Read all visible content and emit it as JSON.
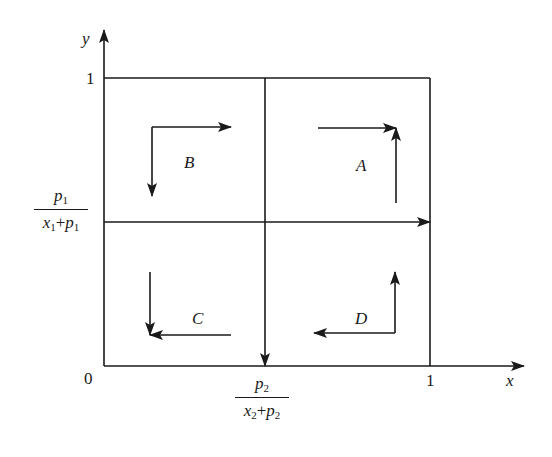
{
  "diagram": {
    "axes": {
      "x_label": "x",
      "y_label": "y",
      "origin_label": "0",
      "x_tick": "1",
      "y_tick": "1"
    },
    "thresholds": {
      "y_threshold": {
        "num_var": "p",
        "num_sub": "1",
        "den_var1": "x",
        "den_sub1": "1",
        "plus": "+",
        "den_var2": "p",
        "den_sub2": "1"
      },
      "x_threshold": {
        "num_var": "p",
        "num_sub": "2",
        "den_var1": "x",
        "den_sub1": "2",
        "plus": "+",
        "den_var2": "p",
        "den_sub2": "2"
      }
    },
    "regions": [
      {
        "id": "A",
        "label": "A",
        "position": "upper-right",
        "arrows": [
          "right",
          "up"
        ]
      },
      {
        "id": "B",
        "label": "B",
        "position": "upper-left",
        "arrows": [
          "right",
          "down"
        ]
      },
      {
        "id": "C",
        "label": "C",
        "position": "lower-left",
        "arrows": [
          "left",
          "down"
        ]
      },
      {
        "id": "D",
        "label": "D",
        "position": "lower-right",
        "arrows": [
          "left",
          "up"
        ]
      }
    ],
    "colors": {
      "ink": "#1a1a1a",
      "background": "#ffffff"
    }
  }
}
